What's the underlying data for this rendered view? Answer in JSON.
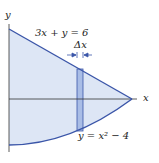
{
  "diagram": {
    "axis_labels": {
      "x": "x",
      "y": "y"
    },
    "curves": [
      {
        "name": "line",
        "equation": "3x + y = 6"
      },
      {
        "name": "parabola",
        "equation": "y = x² − 4"
      }
    ],
    "strip_label": "Δx",
    "colors": {
      "fill": "#dde6f5",
      "curve": "#3a55a8",
      "strip": "#a9bde6",
      "axis": "#333333"
    }
  }
}
